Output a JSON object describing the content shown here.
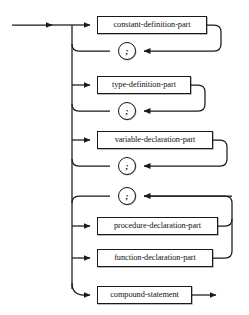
{
  "diagram": {
    "kind": "railroad-syntax-diagram",
    "stroke_color": "#1a1a1a",
    "box_fill": "#ffffff",
    "background": "#ffffff",
    "entry_label": "",
    "exit_label": "",
    "nodes": [
      {
        "id": "constant-definition-part",
        "label": "constant-definition-part",
        "type": "nonterminal",
        "x": 97,
        "y": 16,
        "w": 110,
        "h": 18
      },
      {
        "id": "semicolon-1",
        "label": ";",
        "type": "terminal",
        "cx": 127,
        "cy": 51,
        "r": 9
      },
      {
        "id": "type-definition-part",
        "label": "type-definition-part",
        "type": "nonterminal",
        "x": 97,
        "y": 76,
        "w": 94,
        "h": 18
      },
      {
        "id": "semicolon-2",
        "label": ";",
        "type": "terminal",
        "cx": 127,
        "cy": 111,
        "r": 9
      },
      {
        "id": "variable-declaration-part",
        "label": "variable-declaration-part",
        "type": "nonterminal",
        "x": 97,
        "y": 131,
        "w": 116,
        "h": 18
      },
      {
        "id": "semicolon-3",
        "label": ";",
        "type": "terminal",
        "cx": 127,
        "cy": 166,
        "r": 9
      },
      {
        "id": "semicolon-4",
        "label": ";",
        "type": "terminal",
        "cx": 127,
        "cy": 196,
        "r": 9
      },
      {
        "id": "procedure-declaration-part",
        "label": "procedure-declaration-part",
        "type": "nonterminal",
        "x": 97,
        "y": 217,
        "w": 121,
        "h": 18
      },
      {
        "id": "function-declaration-part",
        "label": "function-declaration-part",
        "type": "nonterminal",
        "x": 97,
        "y": 249,
        "w": 116,
        "h": 18
      },
      {
        "id": "compound-statement",
        "label": "compound-statement",
        "type": "nonterminal",
        "x": 97,
        "y": 286,
        "w": 95,
        "h": 18
      }
    ]
  }
}
